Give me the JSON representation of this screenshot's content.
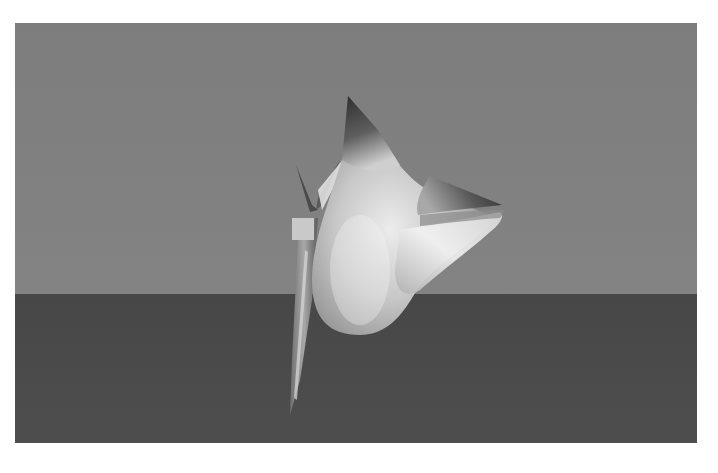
{
  "scene": {
    "description": "3D rendered smooth shaded blob shape with spikes, standing on a plane",
    "colors": {
      "border": "#ffffff",
      "sky": "#7f7f7f",
      "ground": "#4a4a4a",
      "shape_highlight": "#e8e8e8",
      "shape_mid": "#a9a9a9",
      "shape_shadow": "#3a3a3a"
    },
    "horizon_y": 294
  }
}
